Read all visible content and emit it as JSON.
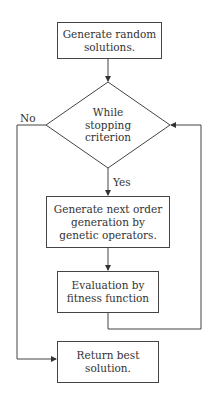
{
  "flowchart": {
    "nodes": {
      "start": {
        "type": "process",
        "text": "Generate random solutions."
      },
      "decision": {
        "type": "decision",
        "text": "While stopping criterion"
      },
      "generate": {
        "type": "process",
        "text": "Generate next order generation by genetic operators."
      },
      "evaluate": {
        "type": "process",
        "text": "Evaluation by fitness function"
      },
      "end": {
        "type": "process",
        "text": "Return best solution."
      }
    },
    "edge_labels": {
      "no": "No",
      "yes": "Yes"
    },
    "edges": [
      {
        "from": "start",
        "to": "decision"
      },
      {
        "from": "decision",
        "to": "generate",
        "label": "Yes"
      },
      {
        "from": "generate",
        "to": "evaluate"
      },
      {
        "from": "evaluate",
        "to": "decision"
      },
      {
        "from": "decision",
        "to": "end",
        "label": "No"
      }
    ],
    "colors": {
      "stroke": "#444444",
      "text": "#333333",
      "background": "#ffffff"
    }
  }
}
